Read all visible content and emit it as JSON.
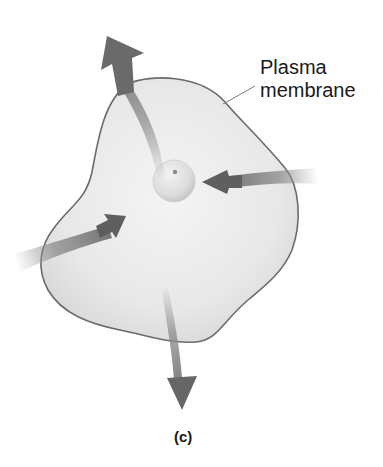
{
  "figure": {
    "panel_label": "(c)",
    "callouts": [
      {
        "line1": "Plasma",
        "line2": "membrane"
      }
    ],
    "elements": {
      "cell": "irregular-cell-body",
      "nucleus": "central-sphere",
      "arrows": [
        {
          "name": "arrow-out-top",
          "direction": "outward"
        },
        {
          "name": "arrow-in-right",
          "direction": "inward"
        },
        {
          "name": "arrow-in-left",
          "direction": "inward"
        },
        {
          "name": "arrow-out-bottom",
          "direction": "outward"
        }
      ]
    },
    "colors": {
      "cell_fill": "#e9e9e9",
      "cell_outline": "#6b6b6b",
      "arrow": "#6e6e6e",
      "text": "#1a1a1a"
    }
  }
}
